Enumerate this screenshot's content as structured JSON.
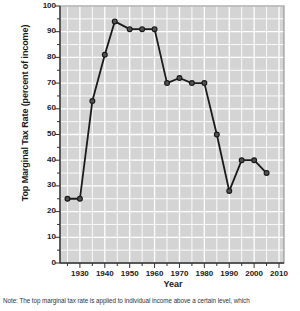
{
  "chart_data": {
    "type": "line",
    "title": "",
    "xlabel": "Year",
    "ylabel": "Top Marginal Tax Rate (percent of income)",
    "xlim": [
      1922,
      2012
    ],
    "ylim": [
      0,
      100
    ],
    "xticks": [
      1930,
      1940,
      1950,
      1960,
      1970,
      1980,
      1990,
      2000,
      2010
    ],
    "yticks": [
      0,
      10,
      20,
      30,
      40,
      50,
      60,
      70,
      80,
      90,
      100
    ],
    "grid": true,
    "legend": "none",
    "marker": "circle",
    "line_color": "#1a1a1a",
    "plot_background": "#d4d4d4",
    "grid_color": "#ffffff",
    "x": [
      1925,
      1930,
      1935,
      1940,
      1944,
      1950,
      1955,
      1960,
      1965,
      1970,
      1975,
      1980,
      1985,
      1990,
      1995,
      2000,
      2005
    ],
    "values": [
      25,
      25,
      63,
      81,
      94,
      91,
      91,
      91,
      70,
      72,
      70,
      70,
      50,
      28,
      40,
      40,
      35
    ],
    "series": [
      {
        "name": "Top Marginal Tax Rate",
        "values": [
          25,
          25,
          63,
          81,
          94,
          91,
          91,
          91,
          70,
          72,
          70,
          70,
          50,
          28,
          40,
          40,
          35
        ]
      }
    ]
  },
  "note": {
    "text": "Note: The top marginal tax rate is applied to individual income above a certain level, which"
  },
  "axis_labels": {
    "y": "Top Marginal Tax Rate (percent of income)",
    "x": "Year"
  }
}
